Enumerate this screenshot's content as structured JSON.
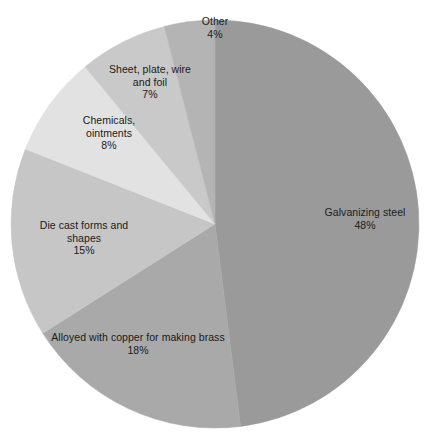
{
  "chart_data": {
    "type": "pie",
    "title": "",
    "subtitle": "",
    "xlabel": "",
    "ylabel": "",
    "legend_position": "none",
    "grid": false,
    "unit": "%",
    "start_angle_deg": 0,
    "direction": "clockwise",
    "center": {
      "x": 215,
      "y": 224
    },
    "radius": 204,
    "categories": [
      "Galvanizing steel",
      "Alloyed with copper for making brass",
      "Die cast forms and shapes",
      "Chemicals, ointments",
      "Sheet, plate, wire and foil",
      "Other"
    ],
    "values": [
      48,
      18,
      15,
      8,
      7,
      4
    ],
    "colors": [
      "#9a9a9a",
      "#a9a9a9",
      "#c6c6c6",
      "#e2e2e2",
      "#c9c9c9",
      "#b4b4b4"
    ],
    "slices": [
      {
        "id": "galvanizing-steel",
        "name": "Galvanizing steel",
        "name_lines": [
          "Galvanizing steel"
        ],
        "value": 48,
        "value_label": "48%",
        "color": "#9a9a9a",
        "start_deg": 0,
        "end_deg": 172.8
      },
      {
        "id": "brass",
        "name": "Alloyed with copper for making brass",
        "name_lines": [
          "Alloyed with copper for making brass"
        ],
        "value": 18,
        "value_label": "18%",
        "color": "#a9a9a9",
        "start_deg": 172.8,
        "end_deg": 237.6
      },
      {
        "id": "die-cast",
        "name": "Die cast forms and shapes",
        "name_lines": [
          "Die cast forms and",
          "shapes"
        ],
        "value": 15,
        "value_label": "15%",
        "color": "#c6c6c6",
        "start_deg": 237.6,
        "end_deg": 291.6
      },
      {
        "id": "chemicals",
        "name": "Chemicals, ointments",
        "name_lines": [
          "Chemicals,",
          "ointments"
        ],
        "value": 8,
        "value_label": "8%",
        "color": "#e2e2e2",
        "start_deg": 291.6,
        "end_deg": 320.4
      },
      {
        "id": "sheet-plate",
        "name": "Sheet, plate, wire and foil",
        "name_lines": [
          "Sheet, plate, wire",
          "and foil"
        ],
        "value": 7,
        "value_label": "7%",
        "color": "#c9c9c9",
        "start_deg": 320.4,
        "end_deg": 345.6
      },
      {
        "id": "other",
        "name": "Other",
        "name_lines": [
          "Other"
        ],
        "value": 4,
        "value_label": "4%",
        "color": "#b4b4b4",
        "start_deg": 345.6,
        "end_deg": 360
      }
    ]
  },
  "labels": {
    "galvanizing_steel": {
      "line1": "Galvanizing steel",
      "value": "48%"
    },
    "brass": {
      "line1": "Alloyed with copper for making brass",
      "value": "18%"
    },
    "die_cast": {
      "line1": "Die cast forms and",
      "line2": "shapes",
      "value": "15%"
    },
    "chemicals": {
      "line1": "Chemicals,",
      "line2": "ointments",
      "value": "8%"
    },
    "sheet_plate": {
      "line1": "Sheet, plate, wire",
      "line2": "and foil",
      "value": "7%"
    },
    "other": {
      "line1": "Other",
      "value": "4%"
    }
  }
}
